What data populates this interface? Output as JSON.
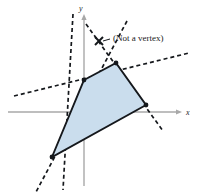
{
  "figure": {
    "title": "",
    "background_color": "#ffffff",
    "width": 198,
    "height": 196
  },
  "axes": {
    "x_label": "x",
    "y_label": "y",
    "axis_color": "#a8a8a8",
    "x_axis": {
      "x1": 8,
      "y1": 112,
      "x2": 182,
      "y2": 112
    },
    "y_axis": {
      "x1": 84,
      "y1": 14,
      "x2": 84,
      "y2": 186
    },
    "x_label_pos": {
      "x": 186,
      "y": 115
    },
    "y_label_pos": {
      "x": 79,
      "y": 11
    }
  },
  "annotation": {
    "text": "(Not a vertex)",
    "text_pos": {
      "x": 113,
      "y": 41
    },
    "leader": {
      "x1": 110,
      "y1": 39,
      "x2": 103,
      "y2": 41
    },
    "marker": {
      "x": 99,
      "y": 41,
      "kind": "x-cross"
    }
  },
  "chart_data": {
    "type": "scatter",
    "title": "",
    "xlabel": "x",
    "ylabel": "y",
    "grid": false,
    "legend": null,
    "origin_px": {
      "x": 84,
      "y": 112
    },
    "polygon": {
      "name": "feasible-region",
      "fill_color": "#cadded",
      "stroke_color": "#15181c",
      "vertices_px": [
        {
          "x": 84,
          "y": 80
        },
        {
          "x": 116,
          "y": 63
        },
        {
          "x": 146,
          "y": 105
        },
        {
          "x": 52,
          "y": 157
        }
      ]
    },
    "vertex_markers": [
      {
        "label": "",
        "x": 84,
        "y": 80
      },
      {
        "label": "",
        "x": 116,
        "y": 63
      },
      {
        "label": "",
        "x": 146,
        "y": 105
      },
      {
        "label": "",
        "x": 52,
        "y": 157
      }
    ],
    "non_vertex_marker": {
      "label": "(Not a vertex)",
      "x": 99,
      "y": 41
    },
    "constraint_lines": [
      {
        "name": "line-a",
        "x1": 14,
        "y1": 96,
        "x2": 189,
        "y2": 53
      },
      {
        "name": "line-b",
        "x1": 73,
        "y1": 14,
        "x2": 63,
        "y2": 190
      },
      {
        "name": "line-c",
        "x1": 86,
        "y1": 24,
        "x2": 163,
        "y2": 131
      },
      {
        "name": "line-d",
        "x1": 127,
        "y1": 21,
        "x2": 36,
        "y2": 192
      }
    ],
    "dash_pattern": "4 3",
    "dash_color": "#15181c"
  }
}
